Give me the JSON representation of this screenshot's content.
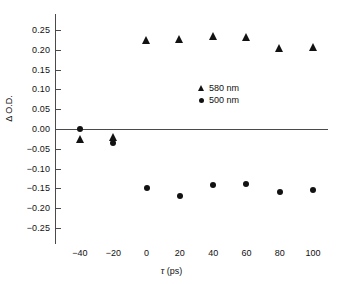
{
  "chart_data": {
    "type": "scatter",
    "title": "",
    "xlabel": "τ (ps)",
    "ylabel": "Δ O.D.",
    "xlim": [
      -50,
      110
    ],
    "ylim": [
      -0.27,
      0.27
    ],
    "grid": false,
    "legend_position": "center-right",
    "x_ticks": [
      -40,
      -20,
      0,
      20,
      40,
      60,
      80,
      100
    ],
    "x_tick_labels": [
      "−40",
      "−20",
      "0",
      "20",
      "40",
      "60",
      "80",
      "100"
    ],
    "y_ticks": [
      0.25,
      0.2,
      0.15,
      0.1,
      0.05,
      0.0,
      -0.05,
      -0.1,
      -0.15,
      -0.2,
      -0.25
    ],
    "y_tick_labels": [
      "0.25",
      "0.20",
      "0.15",
      "0.10",
      "0.05",
      "0.00",
      "−0.05",
      "−0.10",
      "−0.15",
      "−0.20",
      "−0.25"
    ],
    "zero_line": 0.0,
    "series": [
      {
        "name": "580 nm",
        "marker": "triangle",
        "color": "#121212",
        "x": [
          -40,
          -20,
          0,
          20,
          40,
          60,
          80,
          100
        ],
        "values": [
          -0.025,
          -0.02,
          0.225,
          0.227,
          0.236,
          0.233,
          0.205,
          0.208
        ]
      },
      {
        "name": "500 nm",
        "marker": "circle",
        "color": "#121212",
        "x": [
          -40,
          -20,
          0,
          20,
          40,
          60,
          80,
          100
        ],
        "values": [
          0.0,
          -0.035,
          -0.149,
          -0.169,
          -0.142,
          -0.14,
          -0.158,
          -0.153
        ]
      }
    ]
  },
  "legend": {
    "entries": [
      {
        "label": "580 nm",
        "marker": "triangle"
      },
      {
        "label": "500 nm",
        "marker": "circle"
      }
    ]
  },
  "axes": {
    "y_title": "Δ O.D.",
    "x_title_symbol": "τ",
    "x_title_unit": "(ps)"
  }
}
